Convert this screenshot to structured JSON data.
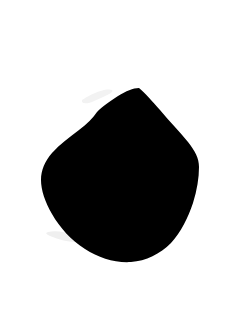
{
  "image": {
    "title": "Black silhouette on white background",
    "width": 250,
    "height": 325,
    "background_color": "#ffffff",
    "subject_color": "#000000",
    "subject_name": "silhouette-blob",
    "subject_description": "Solid black rounded blob with a pointed apex near the top-center-right, a small notch on the upper-left shoulder, a broad bulging left flank and a rounded bottom",
    "alt_text": "Black silhouette shape on a plain white background"
  },
  "shape": {
    "apex": {
      "x": 139,
      "y": 88
    },
    "notch": {
      "x": 97,
      "y": 112
    },
    "leftmost": {
      "x": 41,
      "y": 196
    },
    "rightmost": {
      "x": 199,
      "y": 166
    },
    "bottom": {
      "x": 128,
      "y": 262
    },
    "path": "M139,88 C145,93 152,101 160,110 C170,122 180,132 188,142 C195,151 199,158 199,167 C199,178 197,190 193,203 C188,218 181,232 171,243 C160,254 146,261 131,262 C115,263 99,258 85,249 C71,240 60,228 52,214 C45,202 41,190 41,180 C41,170 45,161 52,153 C60,144 70,137 79,130 C87,124 93,118 97,112 C102,107 110,101 118,96 C126,91 133,88 139,88 Z"
  },
  "marks": [
    {
      "name": "wisp-upper-left",
      "color": "#f2f2f2",
      "path": "M82,100 C88,96 96,92 104,90 C110,89 114,90 112,92 C108,95 99,99 92,102 C87,104 81,104 82,100 Z"
    },
    {
      "name": "wisp-lower-left",
      "color": "#efefef",
      "path": "M48,232 C56,230 66,232 74,236 C79,239 80,242 76,242 C68,242 57,239 50,236 C46,234 45,233 48,232 Z"
    }
  ]
}
